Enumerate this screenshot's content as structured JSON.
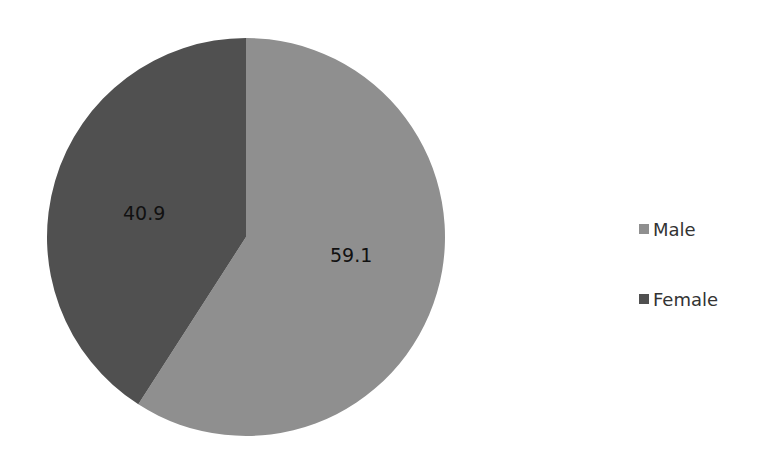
{
  "chart_data": {
    "type": "pie",
    "title": "",
    "categories": [
      "Male",
      "Female"
    ],
    "values": [
      59.1,
      40.9
    ],
    "colors": [
      "#8f8f8f",
      "#505050"
    ],
    "data_labels": [
      "59.1",
      "40.9"
    ],
    "start_angle_deg": 0,
    "direction": "clockwise",
    "legend_position": "right"
  },
  "legend": {
    "items": [
      {
        "label": "Male",
        "color": "#8f8f8f"
      },
      {
        "label": "Female",
        "color": "#505050"
      }
    ]
  },
  "labels": {
    "male_value": "59.1",
    "female_value": "40.9"
  }
}
